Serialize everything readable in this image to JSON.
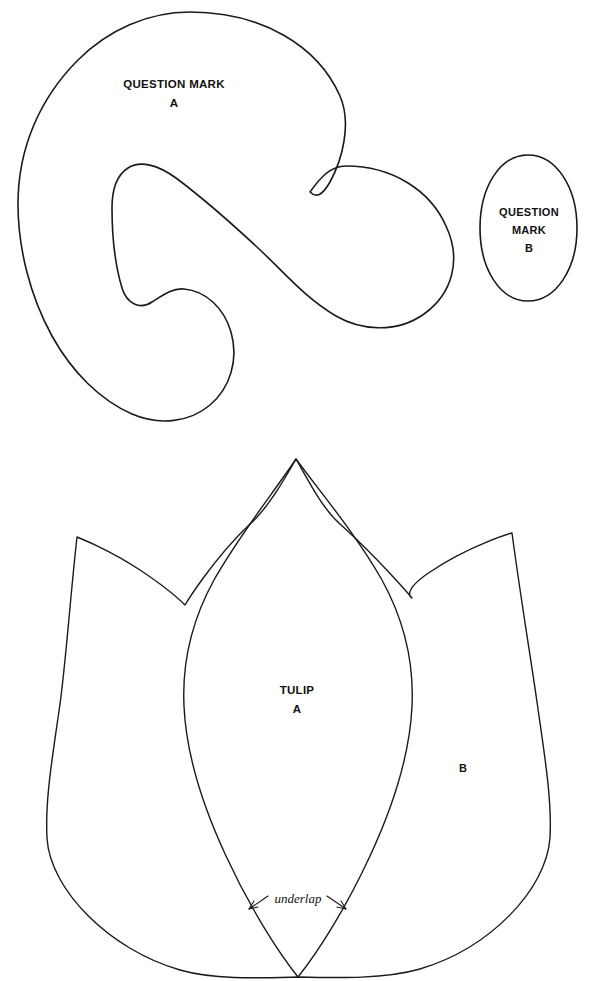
{
  "sheet": {
    "background_color": "#ffffff",
    "ink_color": "#1a1a1a",
    "width": 589,
    "height": 981
  },
  "patterns": {
    "question_mark": {
      "piece_a": {
        "label_line1": "QUESTION MARK",
        "label_line2": "A"
      },
      "piece_b": {
        "label_line1": "QUESTION",
        "label_line2": "MARK",
        "label_line3": "B"
      }
    },
    "tulip": {
      "piece_a": {
        "label_line1": "TULIP",
        "label_line2": "A"
      },
      "piece_b": {
        "label_line1": "B"
      },
      "annotation": {
        "underlap_label": "underlap"
      }
    }
  }
}
